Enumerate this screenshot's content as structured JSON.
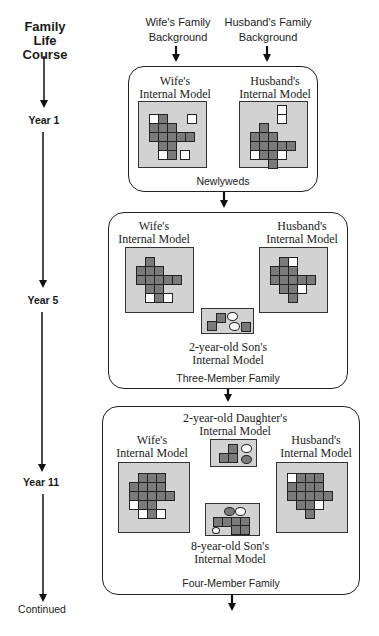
{
  "timeline": {
    "title_lines": [
      "Family",
      "Life",
      "Course"
    ],
    "labels": [
      "Year 1",
      "Year 5",
      "Year 11",
      "Continued"
    ]
  },
  "inputs": {
    "wife_background": [
      "Wife's Family",
      "Background"
    ],
    "husband_background": [
      "Husband's Family",
      "Background"
    ]
  },
  "stages": [
    {
      "name": "Newlyweds",
      "year": "Year 1",
      "models": [
        {
          "label": [
            "Wife's",
            "Internal Model"
          ],
          "cells": [
            [
              0,
              0,
              "w"
            ],
            [
              0,
              1,
              "g"
            ],
            [
              0,
              4,
              "w",
              2
            ],
            [
              1,
              0,
              "g"
            ],
            [
              1,
              1,
              "g"
            ],
            [
              1,
              2,
              "g"
            ],
            [
              2,
              0,
              "g"
            ],
            [
              2,
              1,
              "g"
            ],
            [
              2,
              2,
              "g"
            ],
            [
              2,
              3,
              "g"
            ],
            [
              2,
              4,
              "g"
            ],
            [
              3,
              1,
              "g"
            ],
            [
              3,
              2,
              "g"
            ],
            [
              4,
              1,
              "w"
            ],
            [
              4,
              2,
              "g"
            ],
            [
              4,
              3,
              "w",
              4
            ]
          ]
        },
        {
          "label": [
            "Husband's",
            "Internal Model"
          ],
          "cells": [
            [
              -2,
              3,
              "w"
            ],
            [
              -1,
              3,
              "w"
            ],
            [
              0,
              1,
              "g"
            ],
            [
              1,
              0,
              "g"
            ],
            [
              1,
              1,
              "g"
            ],
            [
              1,
              2,
              "g"
            ],
            [
              2,
              0,
              "g"
            ],
            [
              2,
              1,
              "g"
            ],
            [
              2,
              2,
              "g"
            ],
            [
              2,
              3,
              "g"
            ],
            [
              2,
              4,
              "g"
            ],
            [
              3,
              0,
              "w"
            ],
            [
              3,
              1,
              "g"
            ],
            [
              3,
              2,
              "g"
            ],
            [
              3,
              3,
              "w"
            ],
            [
              4,
              2,
              "g"
            ]
          ]
        }
      ]
    },
    {
      "name": "Three-Member Family",
      "year": "Year 5",
      "models": [
        {
          "label": [
            "Wife's",
            "Internal Model"
          ],
          "cells": [
            [
              0,
              1,
              "g"
            ],
            [
              1,
              0,
              "g"
            ],
            [
              1,
              1,
              "g"
            ],
            [
              1,
              2,
              "g"
            ],
            [
              2,
              0,
              "g"
            ],
            [
              2,
              1,
              "g"
            ],
            [
              2,
              2,
              "g"
            ],
            [
              2,
              3,
              "g"
            ],
            [
              2,
              4,
              "g"
            ],
            [
              3,
              1,
              "g"
            ],
            [
              3,
              2,
              "g"
            ],
            [
              4,
              1,
              "w"
            ],
            [
              4,
              2,
              "g"
            ],
            [
              4,
              3,
              "w"
            ]
          ]
        },
        {
          "label": [
            "Husband's",
            "Internal Model"
          ],
          "cells": [
            [
              0,
              1,
              "g"
            ],
            [
              0,
              2,
              "w"
            ],
            [
              1,
              0,
              "g"
            ],
            [
              1,
              1,
              "g"
            ],
            [
              1,
              2,
              "g"
            ],
            [
              2,
              0,
              "g"
            ],
            [
              2,
              1,
              "g"
            ],
            [
              2,
              2,
              "g"
            ],
            [
              2,
              3,
              "g"
            ],
            [
              2,
              4,
              "g"
            ],
            [
              3,
              1,
              "g"
            ],
            [
              3,
              2,
              "g"
            ],
            [
              3,
              3,
              "w"
            ],
            [
              4,
              2,
              "g"
            ]
          ]
        },
        {
          "label": [
            "2-year-old  Son's",
            "Internal Model"
          ],
          "shapes": [
            "square-gray",
            "circle-white",
            "square-gray",
            "circle-white",
            "square-gray"
          ]
        }
      ]
    },
    {
      "name": "Four-Member Family",
      "year": "Year 11",
      "models": [
        {
          "label": [
            "Wife's",
            "Internal Model"
          ],
          "cells": [
            [
              0,
              1,
              "g"
            ],
            [
              0,
              2,
              "g"
            ],
            [
              0,
              3,
              "g"
            ],
            [
              1,
              0,
              "g"
            ],
            [
              1,
              1,
              "g"
            ],
            [
              1,
              2,
              "g"
            ],
            [
              1,
              3,
              "g"
            ],
            [
              2,
              0,
              "g"
            ],
            [
              2,
              1,
              "g"
            ],
            [
              2,
              2,
              "g"
            ],
            [
              2,
              3,
              "g"
            ],
            [
              2,
              4,
              "g"
            ],
            [
              3,
              0,
              "w"
            ],
            [
              3,
              1,
              "g"
            ],
            [
              3,
              2,
              "g"
            ],
            [
              4,
              1,
              "w"
            ],
            [
              4,
              2,
              "g"
            ],
            [
              4,
              3,
              "w"
            ]
          ]
        },
        {
          "label": [
            "Husband's",
            "Internal Model"
          ],
          "cells": [
            [
              0,
              0,
              "w"
            ],
            [
              0,
              1,
              "g"
            ],
            [
              0,
              2,
              "g"
            ],
            [
              0,
              3,
              "g"
            ],
            [
              1,
              0,
              "g"
            ],
            [
              1,
              1,
              "g"
            ],
            [
              1,
              2,
              "g"
            ],
            [
              1,
              3,
              "g"
            ],
            [
              2,
              0,
              "g"
            ],
            [
              2,
              1,
              "g"
            ],
            [
              2,
              2,
              "g"
            ],
            [
              2,
              3,
              "g"
            ],
            [
              2,
              4,
              "g"
            ],
            [
              3,
              1,
              "g"
            ],
            [
              3,
              2,
              "g"
            ],
            [
              3,
              3,
              "w"
            ],
            [
              4,
              2,
              "g"
            ]
          ]
        },
        {
          "label": [
            "2-year-old Daughter's",
            "Internal Model"
          ],
          "shapes": [
            "square-gray",
            "square-gray",
            "circle-white",
            "circle-gray"
          ]
        },
        {
          "label": [
            "8-year-old  Son's",
            "Internal Model"
          ],
          "shapes": [
            "circle-gray",
            "circle-white",
            "square-gray",
            "circle-small-white"
          ]
        }
      ]
    }
  ],
  "colors": {
    "cell_gray": "#7a7a7a",
    "panel_gray": "#d2d2d2",
    "line": "#222222"
  }
}
